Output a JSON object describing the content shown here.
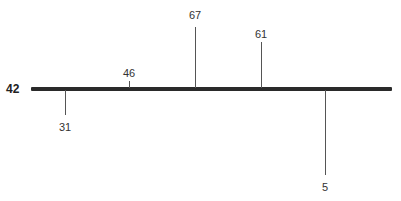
{
  "diagram": {
    "root": {
      "label": "42"
    },
    "nodes": [
      {
        "label": "31",
        "x": 65,
        "direction": "down",
        "tick_end": 115,
        "label_top": 121
      },
      {
        "label": "46",
        "x": 129,
        "direction": "up",
        "tick_end": 81,
        "label_top": 67
      },
      {
        "label": "67",
        "x": 195,
        "direction": "up",
        "tick_end": 27,
        "label_top": 9
      },
      {
        "label": "61",
        "x": 261,
        "direction": "up",
        "tick_end": 42,
        "label_top": 28
      },
      {
        "label": "5",
        "x": 325,
        "direction": "down",
        "tick_end": 175,
        "label_top": 181
      }
    ],
    "colors": {
      "axis": "#2a2a2a",
      "tick": "#555555",
      "text": "#333333"
    }
  }
}
